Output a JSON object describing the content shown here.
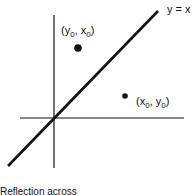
{
  "diagram": {
    "line_label": "y = x",
    "point_a": {
      "open": "(",
      "v1": "y",
      "s1": "0",
      "sep": ", ",
      "v2": "x",
      "s2": "0",
      "close": ")"
    },
    "point_b": {
      "open": "(",
      "v1": "x",
      "s1": "0",
      "sep": ", ",
      "v2": "y",
      "s2": "0",
      "close": ")"
    },
    "caption": "Reflection across",
    "colors": {
      "ink": "#111111",
      "background": "#ffffff"
    }
  }
}
